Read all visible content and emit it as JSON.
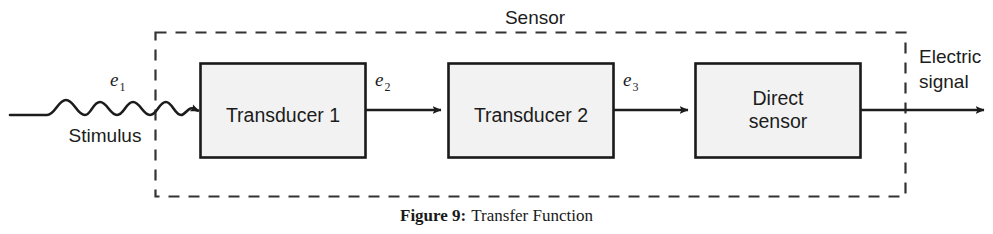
{
  "figure": {
    "caption_label": "Figure 9:",
    "caption_text": "Transfer Function",
    "enclosure_label": "Sensor"
  },
  "colors": {
    "stroke": "#1c1c1c",
    "box_fill": "#f2f2f2",
    "box_border": "#1a1a1a",
    "dashed_border": "#333333",
    "background": "#ffffff",
    "text": "#1c1c1c"
  },
  "blocks": [
    {
      "id": "transducer-1",
      "label": "Transducer 1",
      "label_lines": [
        "Transducer 1"
      ]
    },
    {
      "id": "transducer-2",
      "label": "Transducer 2",
      "label_lines": [
        "Transducer 2"
      ]
    },
    {
      "id": "direct-sensor",
      "label": "Direct sensor",
      "label_lines": [
        "Direct",
        "sensor"
      ]
    }
  ],
  "signals": [
    {
      "id": "e1",
      "base": "e",
      "sub": "1"
    },
    {
      "id": "e2",
      "base": "e",
      "sub": "2"
    },
    {
      "id": "e3",
      "base": "e",
      "sub": "3"
    }
  ],
  "input": {
    "label": "Stimulus"
  },
  "output": {
    "label_lines": [
      "Electric",
      "signal"
    ],
    "label": "Electric signal"
  }
}
